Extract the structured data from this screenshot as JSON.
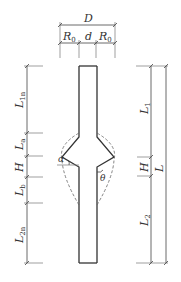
{
  "diagram": {
    "type": "pile-dimension-drawing",
    "top_dims": {
      "overall": "D",
      "left_segment": "R",
      "left_segment_sub": "0",
      "middle_segment": "d",
      "right_segment": "R",
      "right_segment_sub": "0"
    },
    "left_dims": [
      {
        "main": "L",
        "sub": "1n"
      },
      {
        "main": "L",
        "sub": "a"
      },
      {
        "main": "H",
        "sub": ""
      },
      {
        "main": "L",
        "sub": "b"
      },
      {
        "main": "L",
        "sub": "2n"
      }
    ],
    "right_dims": [
      {
        "main": "L",
        "sub": "1"
      },
      {
        "main": "H",
        "sub": ""
      },
      {
        "main": "L",
        "sub": "2"
      },
      {
        "main": "L",
        "sub": ""
      }
    ],
    "angles": {
      "alpha": "α",
      "theta": "θ"
    }
  }
}
